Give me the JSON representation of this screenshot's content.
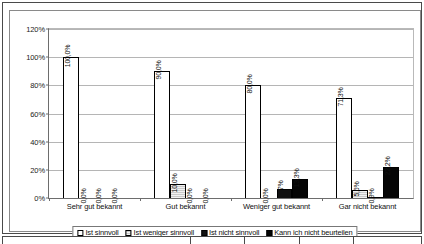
{
  "chart_data": {
    "type": "bar",
    "title": "",
    "subtitle": "",
    "xlabel": "",
    "ylabel": "",
    "ylim": [
      0,
      120
    ],
    "ytick_labels": [
      "0%",
      "20%",
      "40%",
      "60%",
      "80%",
      "100%",
      "120%"
    ],
    "ytick_values": [
      0,
      20,
      40,
      60,
      80,
      100,
      120
    ],
    "grid": true,
    "legend_position": "bottom",
    "categories": [
      "Sehr gut bekannt",
      "Gut bekannt",
      "Weniger gut bekannt",
      "Gar nicht bekannt"
    ],
    "series": [
      {
        "name": "Ist sinnvoll",
        "fill": "white",
        "values": [
          100.0,
          90.0,
          80.0,
          71.3
        ],
        "labels": [
          "100,0%",
          "90,0%",
          "80,0%",
          "71,3%"
        ]
      },
      {
        "name": "Ist weniger sinnvoll",
        "fill": "gray-hatch",
        "values": [
          0.0,
          10.0,
          0.0,
          5.6
        ],
        "labels": [
          "0,0%",
          "10,0%",
          "0,0%",
          "5,6%"
        ]
      },
      {
        "name": "Ist nicht sinnvoll",
        "fill": "black",
        "values": [
          0.0,
          0.0,
          6.7,
          0.9
        ],
        "labels": [
          "0,0%",
          "0,0%",
          "6,7%",
          "0,9%"
        ]
      },
      {
        "name": "Kann ich nicht beurteilen",
        "fill": "black",
        "values": [
          0.0,
          0.0,
          13.3,
          22.2
        ],
        "labels": [
          "0,0%",
          "0,0%",
          "13,3%",
          "22,2%"
        ]
      }
    ]
  },
  "legend": {
    "items": [
      "Ist sinnvoll",
      "Ist weniger sinnvoll",
      "Ist nicht sinnvoll",
      "Kann ich nicht beurteilen"
    ]
  },
  "colors": {
    "series_1": "#ffffff",
    "series_2": "#c9c9c9",
    "series_3": "#111111",
    "series_4": "#050505",
    "axis": "#6d6d6d",
    "grid": "#b5b5b5",
    "frame": "#4a4a4a"
  }
}
